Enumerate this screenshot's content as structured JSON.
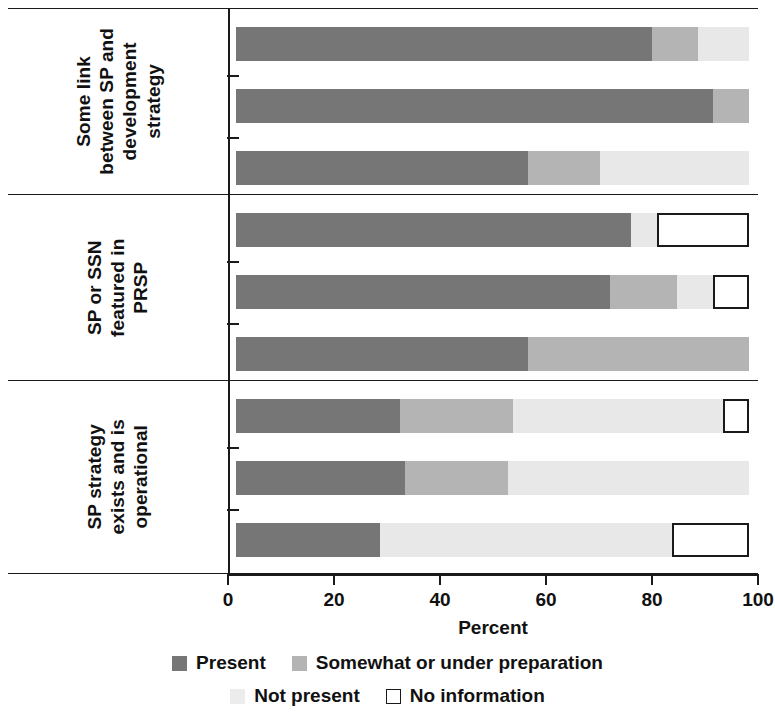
{
  "chart_data": {
    "type": "bar",
    "orientation": "horizontal",
    "stacked": true,
    "stack_total": 100,
    "title": "",
    "xlabel": "Percent",
    "ylabel": "",
    "xlim": [
      0,
      100
    ],
    "xticks": [
      0,
      20,
      40,
      60,
      80,
      100
    ],
    "xticklabels": [
      "0",
      "20",
      "40",
      "60",
      "80",
      "100"
    ],
    "grid": false,
    "legend_position": "bottom",
    "series": [
      {
        "name": "Present",
        "color": "#767676"
      },
      {
        "name": "Somewhat or under preparation",
        "color": "#b4b4b4"
      },
      {
        "name": "Not present",
        "color": "#e8e8e8"
      },
      {
        "name": "No information",
        "color": "#ffffff"
      }
    ],
    "panels": [
      {
        "label_lines": [
          "Some link",
          "between SP and",
          "development",
          "strategy"
        ],
        "categories": [
          "All 22",
          "15 LICs",
          "7 MICs"
        ],
        "values": {
          "Present": [
            81,
            93,
            57
          ],
          "Somewhat or under preparation": [
            9,
            7,
            14
          ],
          "Not present": [
            10,
            0,
            29
          ],
          "No information": [
            0,
            0,
            0
          ]
        }
      },
      {
        "label_lines": [
          "SP or SSN",
          "featured in",
          "PRSP"
        ],
        "categories": [
          "All 22",
          "15 LICs",
          "7 MICs"
        ],
        "values": {
          "Present": [
            77,
            73,
            57
          ],
          "Somewhat or under preparation": [
            0,
            13,
            43
          ],
          "Not present": [
            5,
            7,
            0
          ],
          "No information": [
            18,
            7,
            0
          ]
        }
      },
      {
        "label_lines": [
          "SP strategy",
          "exists and is",
          "operational"
        ],
        "categories": [
          "All 22",
          "15 LICs",
          "7 MICs"
        ],
        "values": {
          "Present": [
            32,
            33,
            28
          ],
          "Somewhat or under preparation": [
            22,
            20,
            0
          ],
          "Not present": [
            41,
            47,
            57
          ],
          "No information": [
            5,
            0,
            15
          ]
        }
      }
    ]
  },
  "axis": {
    "x_title": "Percent",
    "ticks": [
      "0",
      "20",
      "40",
      "60",
      "80",
      "100"
    ]
  },
  "legend": {
    "items": [
      {
        "label": "Present",
        "swatch": "present"
      },
      {
        "label": "Somewhat or under preparation",
        "swatch": "somewhat"
      },
      {
        "label": "Not present",
        "swatch": "notpresent"
      },
      {
        "label": "No information",
        "swatch": "noinfo"
      }
    ]
  },
  "panel_labels": [
    "Some link between SP and development strategy",
    "SP or SSN featured in PRSP",
    "SP strategy exists and is operational"
  ]
}
